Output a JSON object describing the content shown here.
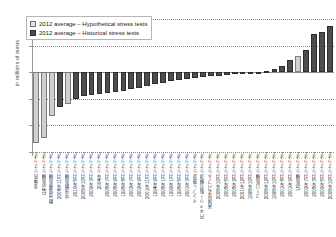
{
  "chart_data": {
    "type": "bar",
    "title": "",
    "subtitle": "",
    "xlabel": "",
    "ylabel": "in millions of euros",
    "ylim": [
      -600,
      400
    ],
    "yticks": [
      400,
      200,
      0,
      -200,
      -400,
      -600
    ],
    "grid": true,
    "legend_position": "top-left",
    "legend": [
      {
        "label": "2012 average – Hypothetical stress tests",
        "key": "hypothetical",
        "color": "#cfcfcf"
      },
      {
        "label": "2012 average – Historical stress tests",
        "key": "historical",
        "color": "#4d4d4d"
      }
    ],
    "categories": [
      "全体的シナリオ",
      "GIPS危機シナリオ",
      "欧州債務危機シナリオ",
      "2008年11月シナリオ",
      "中央欧危機シナリオ",
      "2010年5月シナリオ",
      "2008年10月シナリオ",
      "2009年3月シナリオ",
      "2004年シナリオ",
      "2008年7月シナリオ",
      "2008年9月シナリオ",
      "1998年8月シナリオ",
      "2003年7月シナリオ",
      "2002年9月シナリオ",
      "2001年11月シナリオ",
      "1994年9月シナリオ",
      "2008年1月シナリオ",
      "1999年1月シナリオ",
      "1998年5月シナリオ",
      "2001年3月シナリオ",
      "インフレ懸念シナリオ",
      "円キャリー取引解消シナリオ",
      "米国住宅バブルシナリオ",
      "2008年10月シナリオ",
      "2008年5月シナリオ",
      "2008年2月シナリオ",
      "2001年12月シナリオ",
      "1998年10月シナリオ",
      "ユーロ危機シナリオ",
      "2008年12月シナリオ",
      "1998年10月シナリオ",
      "2001年8月シナリオ",
      "2001年9月シナリオ",
      "US危機シナリオ",
      "2002年7月シナリオ",
      "2008年3月シナリオ",
      "2009年5月シナリオ",
      "2008年10月シナリオ"
    ],
    "series": [
      {
        "name": "2012 average – Hypothetical stress tests",
        "key": "hypothetical",
        "values": [
          -530,
          -495,
          -330,
          null,
          -240,
          null,
          null,
          null,
          null,
          null,
          null,
          null,
          null,
          null,
          null,
          null,
          null,
          null,
          null,
          null,
          null,
          null,
          null,
          null,
          null,
          null,
          null,
          null,
          null,
          25,
          null,
          null,
          null,
          null,
          null,
          null,
          null,
          null
        ]
      },
      {
        "name": "2012 average – Historical stress tests",
        "key": "historical",
        "values": [
          null,
          null,
          null,
          -260,
          null,
          -205,
          -180,
          -172,
          -165,
          -158,
          -150,
          -142,
          -130,
          -118,
          -105,
          -92,
          -80,
          -70,
          -60,
          -52,
          -44,
          -38,
          -32,
          -26,
          -20,
          -16,
          -12,
          -9,
          -6,
          null,
          12,
          22,
          45,
          95,
          120,
          230,
          280,
          310
        ]
      }
    ],
    "bars": [
      {
        "category": "全体的シナリオ",
        "value": -530,
        "key": "hypothetical"
      },
      {
        "category": "GIPS危機シナリオ",
        "value": -495,
        "key": "hypothetical"
      },
      {
        "category": "欧州債務危機シナリオ",
        "value": -330,
        "key": "hypothetical"
      },
      {
        "category": "2008年11月シナリオ",
        "value": -260,
        "key": "historical"
      },
      {
        "category": "中央欧危機シナリオ",
        "value": -240,
        "key": "hypothetical"
      },
      {
        "category": "2010年5月シナリオ",
        "value": -205,
        "key": "historical"
      },
      {
        "category": "2008年10月シナリオ",
        "value": -180,
        "key": "historical"
      },
      {
        "category": "2009年3月シナリオ",
        "value": -172,
        "key": "historical"
      },
      {
        "category": "2004年シナリオ",
        "value": -165,
        "key": "historical"
      },
      {
        "category": "2008年7月シナリオ",
        "value": -158,
        "key": "historical"
      },
      {
        "category": "2008年9月シナリオ",
        "value": -150,
        "key": "historical"
      },
      {
        "category": "1998年8月シナリオ",
        "value": -142,
        "key": "historical"
      },
      {
        "category": "2003年7月シナリオ",
        "value": -130,
        "key": "historical"
      },
      {
        "category": "2002年9月シナリオ",
        "value": -118,
        "key": "historical"
      },
      {
        "category": "2001年11月シナリオ",
        "value": -105,
        "key": "historical"
      },
      {
        "category": "1994年9月シナリオ",
        "value": -92,
        "key": "historical"
      },
      {
        "category": "2008年1月シナリオ",
        "value": -80,
        "key": "historical"
      },
      {
        "category": "1999年1月シナリオ",
        "value": -70,
        "key": "historical"
      },
      {
        "category": "1998年5月シナリオ",
        "value": -60,
        "key": "historical"
      },
      {
        "category": "2001年3月シナリオ",
        "value": -52,
        "key": "historical"
      },
      {
        "category": "インフレ懸念シナリオ",
        "value": -44,
        "key": "historical"
      },
      {
        "category": "円キャリー取引解消シナリオ",
        "value": -38,
        "key": "historical"
      },
      {
        "category": "米国住宅バブルシナリオ",
        "value": -32,
        "key": "historical"
      },
      {
        "category": "2008年10月シナリオ",
        "value": -26,
        "key": "historical"
      },
      {
        "category": "2008年5月シナリオ",
        "value": -20,
        "key": "historical"
      },
      {
        "category": "2008年2月シナリオ",
        "value": -16,
        "key": "historical"
      },
      {
        "category": "2001年12月シナリオ",
        "value": -12,
        "key": "historical"
      },
      {
        "category": "1998年10月シナリオ",
        "value": -9,
        "key": "historical"
      },
      {
        "category": "ユーロ危機シナリオ",
        "value": -6,
        "key": "historical"
      },
      {
        "category": "2008年12月シナリオ",
        "value": 12,
        "key": "historical"
      },
      {
        "category": "1998年10月シナリオ",
        "value": 22,
        "key": "historical"
      },
      {
        "category": "2001年8月シナリオ",
        "value": 45,
        "key": "historical"
      },
      {
        "category": "2001年9月シナリオ",
        "value": 95,
        "key": "historical"
      },
      {
        "category": "US危機シナリオ",
        "value": 120,
        "key": "hypothetical"
      },
      {
        "category": "2002年7月シナリオ",
        "value": 170,
        "key": "historical"
      },
      {
        "category": "2008年3月シナリオ",
        "value": 290,
        "key": "historical"
      },
      {
        "category": "2009年5月シナリオ",
        "value": 300,
        "key": "historical"
      },
      {
        "category": "2008年10月シナリオ",
        "value": 345,
        "key": "historical"
      }
    ]
  }
}
